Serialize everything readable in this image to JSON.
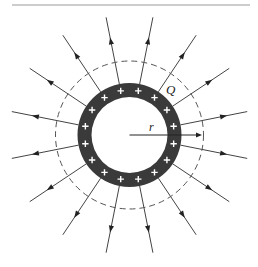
{
  "figure": {
    "type": "charged-spherical-shell-field-diagram",
    "labels": {
      "charge": "Q",
      "radius": "r"
    },
    "top_rule": {
      "x1": 12,
      "x2": 250,
      "y": 5,
      "color": "#9a9a9a"
    },
    "center": {
      "x": 129.5,
      "y": 135
    },
    "shell": {
      "outer_radius": 52,
      "inner_radius": 38,
      "fill": "#3a3a3a",
      "charge_symbol": "+",
      "charge_count": 16,
      "charge_radius": 45,
      "charge_color": "#ffffff"
    },
    "gaussian_surface": {
      "radius": 74,
      "style": "dashed",
      "color": "#555555"
    },
    "field_lines": {
      "count": 16,
      "angle_offset_deg": 11.25,
      "start_radius": 52,
      "end_radius": 120,
      "arrow_radius": 96,
      "color": "#444444",
      "direction": "outward"
    },
    "radius_arrow": {
      "end_x": 199,
      "label_x": 149,
      "label_y": 131
    },
    "charge_label_pos": {
      "x": 166,
      "y": 94
    }
  }
}
